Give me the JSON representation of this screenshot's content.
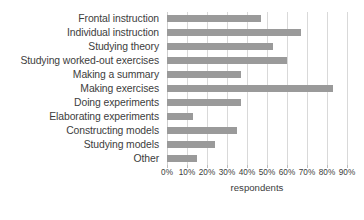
{
  "chart_data": {
    "type": "bar",
    "orientation": "horizontal",
    "title": "",
    "xlabel": "respondents",
    "ylabel": "",
    "xlim": [
      0,
      90
    ],
    "xtick_labels": [
      "0%",
      "10%",
      "20%",
      "30%",
      "40%",
      "50%",
      "60%",
      "70%",
      "80%",
      "90%"
    ],
    "xticks": [
      0,
      10,
      20,
      30,
      40,
      50,
      60,
      70,
      80,
      90
    ],
    "grid": true,
    "legend": false,
    "bar_color": "#9a9a9a",
    "gridline_color": "#d9d9d9",
    "categories": [
      "Frontal instruction",
      "Individual instruction",
      "Studying theory",
      "Studying worked-out exercises",
      "Making a summary",
      "Making exercises",
      "Doing experiments",
      "Elaborating experiments",
      "Constructing models",
      "Studying models",
      "Other"
    ],
    "values": [
      47,
      67,
      53,
      60,
      37,
      83,
      37,
      13,
      35,
      24,
      15
    ],
    "series": [
      {
        "name": "respondents",
        "values": [
          47,
          67,
          53,
          60,
          37,
          83,
          37,
          13,
          35,
          24,
          15
        ]
      }
    ]
  }
}
